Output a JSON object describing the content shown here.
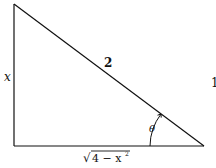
{
  "diagram": {
    "type": "right-triangle",
    "labels": {
      "opposite_side": "x",
      "hypotenuse": "2",
      "angle": "θ",
      "adjacent_side_radicand": "4 − x",
      "adjacent_side_exponent": "2",
      "adjacent_side_radical": "√",
      "edge_fragment": "1"
    },
    "colors": {
      "stroke": "#111111",
      "background": "#ffffff"
    }
  }
}
